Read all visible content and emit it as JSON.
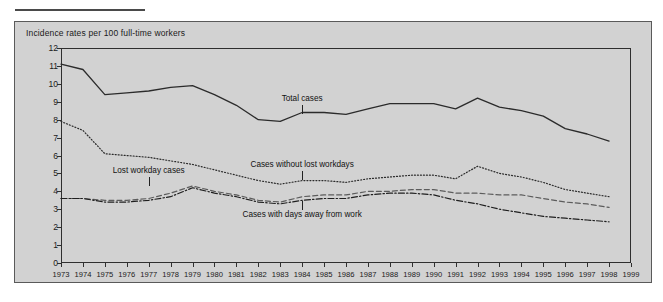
{
  "figure": {
    "caption": "Incidence rates per 100 full-time workers"
  },
  "chart_data": {
    "type": "line",
    "title": "Incidence rates per 100 full-time workers",
    "xlabel": "",
    "ylabel": "",
    "ylim": [
      0,
      12
    ],
    "xlim": [
      1973,
      1999
    ],
    "grid": false,
    "legend_position": "inline-annotations",
    "yticks": [
      0,
      1,
      2,
      3,
      4,
      5,
      6,
      7,
      8,
      9,
      10,
      11,
      12
    ],
    "x": [
      1973,
      1974,
      1975,
      1976,
      1977,
      1978,
      1979,
      1980,
      1981,
      1982,
      1983,
      1984,
      1985,
      1986,
      1987,
      1988,
      1989,
      1990,
      1991,
      1992,
      1993,
      1994,
      1995,
      1996,
      1997,
      1998
    ],
    "xticklabels": [
      "1973",
      "1974",
      "1975",
      "1976",
      "1977",
      "1978",
      "1979",
      "1980",
      "1981",
      "1982",
      "1983",
      "1984",
      "1985",
      "1986",
      "1987",
      "1988",
      "1989",
      "1990",
      "1991",
      "1992",
      "1993",
      "1994",
      "1995",
      "1996",
      "1997",
      "1998",
      "1999"
    ],
    "series": [
      {
        "name": "Total cases",
        "style": "solid",
        "color": "#2b2b2b",
        "label_x": 1984,
        "label_y": 9.1,
        "values": [
          11.1,
          10.8,
          9.4,
          9.5,
          9.6,
          9.8,
          9.9,
          9.4,
          8.8,
          8.0,
          7.9,
          8.4,
          8.4,
          8.3,
          8.6,
          8.9,
          8.9,
          8.9,
          8.6,
          9.2,
          8.7,
          8.5,
          8.2,
          7.5,
          7.2,
          6.8
        ]
      },
      {
        "name": "Cases without lost workdays",
        "style": "dotted",
        "color": "#2b2b2b",
        "label_x": 1984,
        "label_y": 5.4,
        "values": [
          7.9,
          7.4,
          6.1,
          6.0,
          5.9,
          5.7,
          5.5,
          5.2,
          4.9,
          4.6,
          4.4,
          4.6,
          4.6,
          4.5,
          4.7,
          4.8,
          4.9,
          4.9,
          4.7,
          5.4,
          5.0,
          4.8,
          4.5,
          4.1,
          3.9,
          3.7
        ]
      },
      {
        "name": "Lost workday cases",
        "style": "dashed",
        "color": "#5c5c5c",
        "label_x": 1977,
        "label_y": 5.1,
        "values": [
          3.6,
          3.6,
          3.5,
          3.5,
          3.6,
          3.9,
          4.3,
          4.0,
          3.8,
          3.5,
          3.4,
          3.7,
          3.8,
          3.8,
          4.0,
          4.0,
          4.1,
          4.1,
          3.9,
          3.9,
          3.8,
          3.8,
          3.6,
          3.4,
          3.3,
          3.1
        ]
      },
      {
        "name": "Cases with days away from work",
        "style": "dashdot",
        "color": "#1f1f1f",
        "label_x": 1984,
        "label_y": 2.6,
        "values": [
          3.6,
          3.6,
          3.4,
          3.4,
          3.5,
          3.7,
          4.2,
          3.9,
          3.7,
          3.4,
          3.3,
          3.5,
          3.6,
          3.6,
          3.8,
          3.9,
          3.9,
          3.8,
          3.5,
          3.3,
          3.0,
          2.8,
          2.6,
          2.5,
          2.4,
          2.3
        ]
      }
    ]
  }
}
